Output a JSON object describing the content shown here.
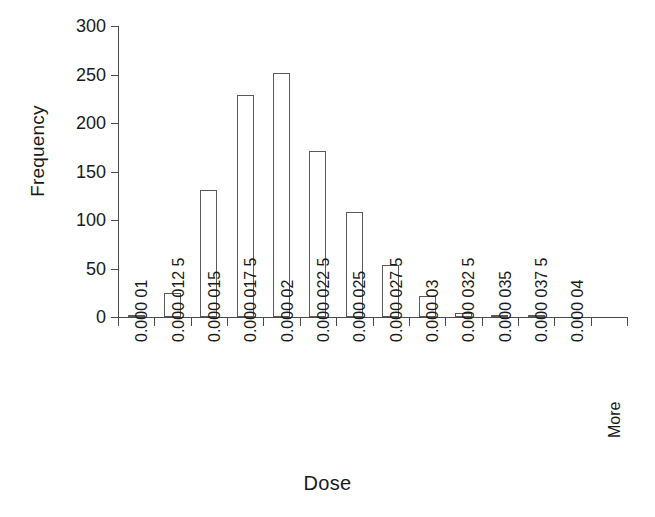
{
  "chart_data": {
    "type": "bar",
    "title": "",
    "subtitle": "",
    "xlabel": "Dose",
    "ylabel": "Frequency",
    "categories": [
      "0.000 01",
      "0.000 012 5",
      "0.000 015",
      "0.000 017 5",
      "0.000 02",
      "0.000 022 5",
      "0.000 025",
      "0.000 027 5",
      "0.000 03",
      "0.000 032 5",
      "0.000 035",
      "0.000 037 5",
      "0.000 04",
      "More"
    ],
    "values": [
      2,
      25,
      131,
      229,
      252,
      171,
      108,
      54,
      22,
      4,
      1,
      2,
      0,
      0
    ],
    "ylim": [
      0,
      300
    ],
    "yticks": [
      0,
      50,
      100,
      150,
      200,
      250,
      300
    ],
    "ytick_labels": [
      "0",
      "50",
      "100",
      "150",
      "200",
      "250",
      "300"
    ],
    "grid": false,
    "legend": false,
    "legend_position": "none",
    "bar_fill_color": "#ffffff",
    "bar_edge_color": "#5a5a5a",
    "axis_color": "#4a4a4a",
    "text_color": "#1a1a1a",
    "background_color": "#ffffff"
  }
}
